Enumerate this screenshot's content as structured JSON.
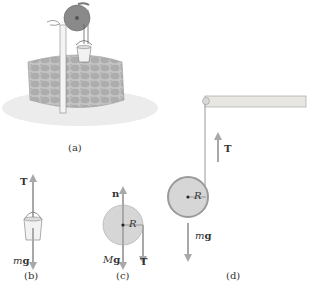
{
  "panels": {
    "a": {
      "caption": "(a)",
      "description": "Well with windlass pulley and hanging bucket"
    },
    "b": {
      "caption": "(b)",
      "force_up": "T",
      "force_down_prefix": "m",
      "force_down": "g"
    },
    "c": {
      "caption": "(c)",
      "normal": "n",
      "weight_prefix": "M",
      "weight": "g",
      "radius": "R",
      "tension": "T"
    },
    "d": {
      "caption": "(d)",
      "tension": "T",
      "radius": "R",
      "weight_prefix": "m",
      "weight": "g"
    }
  },
  "colors": {
    "arrow": "#a8a8a8",
    "disk_fill": "#d6d6d6",
    "disk_edge": "#9a9a9a",
    "beam": "#e9e7e2",
    "stone": "#b9b9b9",
    "text": "#333333"
  }
}
